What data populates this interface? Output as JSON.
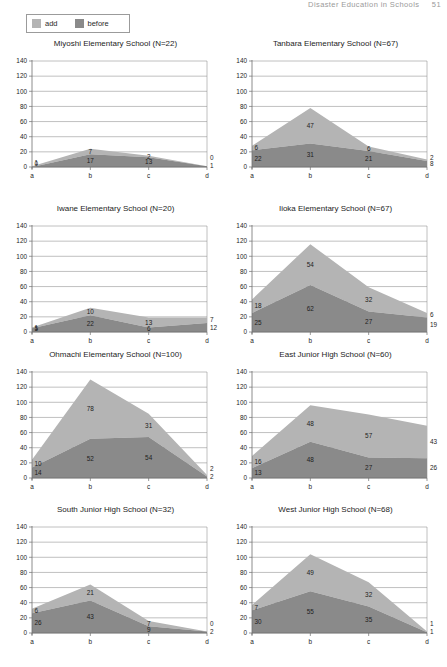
{
  "header": {
    "title": "Disaster Education in Schools",
    "page": "51"
  },
  "legend": {
    "items": [
      {
        "label": "add",
        "color": "#b4b4b4",
        "key": "add"
      },
      {
        "label": "before",
        "color": "#8a8a8a",
        "key": "before"
      }
    ]
  },
  "axis": {
    "y_ticks": [
      "0",
      "20",
      "40",
      "60",
      "80",
      "100",
      "120",
      "140"
    ],
    "x_ticks": [
      "a",
      "b",
      "c",
      "d"
    ],
    "ymin": 0,
    "ymax": 140
  },
  "chart_data": [
    {
      "type": "area",
      "title": "Miyoshi Elementary School (N=22)",
      "categories": [
        "a",
        "b",
        "c",
        "d"
      ],
      "series": [
        {
          "name": "before",
          "values": [
            0,
            17,
            13,
            1
          ],
          "color": "#8a8a8a"
        },
        {
          "name": "add",
          "values": [
            1,
            7,
            2,
            0
          ],
          "color": "#b4b4b4"
        }
      ],
      "xlabel": "",
      "ylabel": "",
      "ylim": [
        0,
        140
      ],
      "grid": true,
      "stacked": true
    },
    {
      "type": "area",
      "title": "Tanbara Elementary School (N=67)",
      "categories": [
        "a",
        "b",
        "c",
        "d"
      ],
      "series": [
        {
          "name": "before",
          "values": [
            22,
            31,
            21,
            8
          ],
          "color": "#8a8a8a"
        },
        {
          "name": "add",
          "values": [
            6,
            47,
            6,
            2
          ],
          "color": "#b4b4b4"
        }
      ],
      "xlabel": "",
      "ylabel": "",
      "ylim": [
        0,
        140
      ],
      "grid": true,
      "stacked": true
    },
    {
      "type": "area",
      "title": "Iwane Elementary School (N=20)",
      "categories": [
        "a",
        "b",
        "c",
        "d"
      ],
      "series": [
        {
          "name": "before",
          "values": [
            5,
            22,
            6,
            12
          ],
          "color": "#8a8a8a"
        },
        {
          "name": "add",
          "values": [
            1,
            10,
            13,
            7
          ],
          "color": "#b4b4b4"
        }
      ],
      "xlabel": "",
      "ylabel": "",
      "ylim": [
        0,
        140
      ],
      "grid": true,
      "stacked": true
    },
    {
      "type": "area",
      "title": "Iioka Elementary School (N=67)",
      "categories": [
        "a",
        "b",
        "c",
        "d"
      ],
      "series": [
        {
          "name": "before",
          "values": [
            25,
            62,
            27,
            19
          ],
          "color": "#8a8a8a"
        },
        {
          "name": "add",
          "values": [
            18,
            54,
            32,
            6
          ],
          "color": "#b4b4b4"
        }
      ],
      "xlabel": "",
      "ylabel": "",
      "ylim": [
        0,
        140
      ],
      "grid": true,
      "stacked": true
    },
    {
      "type": "area",
      "title": "Ohmachi Elementary School (N=100)",
      "categories": [
        "a",
        "b",
        "c",
        "d"
      ],
      "series": [
        {
          "name": "before",
          "values": [
            14,
            52,
            54,
            2
          ],
          "color": "#8a8a8a"
        },
        {
          "name": "add",
          "values": [
            10,
            78,
            31,
            2
          ],
          "color": "#b4b4b4"
        }
      ],
      "xlabel": "",
      "ylabel": "",
      "ylim": [
        0,
        140
      ],
      "grid": true,
      "stacked": true
    },
    {
      "type": "area",
      "title": "East Junior High School (N=60)",
      "categories": [
        "a",
        "b",
        "c",
        "d"
      ],
      "series": [
        {
          "name": "before",
          "values": [
            13,
            48,
            27,
            26
          ],
          "color": "#8a8a8a"
        },
        {
          "name": "add",
          "values": [
            16,
            48,
            57,
            43
          ],
          "color": "#b4b4b4"
        }
      ],
      "xlabel": "",
      "ylabel": "",
      "ylim": [
        0,
        140
      ],
      "grid": true,
      "stacked": true
    },
    {
      "type": "area",
      "title": "South Junior High School (N=32)",
      "categories": [
        "a",
        "b",
        "c",
        "d"
      ],
      "series": [
        {
          "name": "before",
          "values": [
            26,
            43,
            9,
            2
          ],
          "color": "#8a8a8a"
        },
        {
          "name": "add",
          "values": [
            6,
            21,
            7,
            0
          ],
          "color": "#b4b4b4"
        }
      ],
      "xlabel": "",
      "ylabel": "",
      "ylim": [
        0,
        140
      ],
      "grid": true,
      "stacked": true
    },
    {
      "type": "area",
      "title": "West Junior High School (N=68)",
      "categories": [
        "a",
        "b",
        "c",
        "d"
      ],
      "series": [
        {
          "name": "before",
          "values": [
            30,
            55,
            35,
            1
          ],
          "color": "#8a8a8a"
        },
        {
          "name": "add",
          "values": [
            7,
            49,
            32,
            1
          ],
          "color": "#b4b4b4"
        }
      ],
      "xlabel": "",
      "ylabel": "",
      "ylim": [
        0,
        140
      ],
      "grid": true,
      "stacked": true
    }
  ]
}
